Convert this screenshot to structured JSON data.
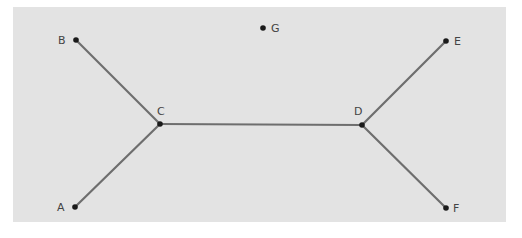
{
  "diagram": {
    "type": "graph",
    "background": "#e3e3e3",
    "edge_color": "#6e6e6e",
    "node_color": "#1a1a1a",
    "nodes": [
      {
        "id": "A",
        "label": "A",
        "x": 75,
        "y": 207,
        "label_x": 57,
        "label_y": 211
      },
      {
        "id": "B",
        "label": "B",
        "x": 76,
        "y": 40,
        "label_x": 58,
        "label_y": 44
      },
      {
        "id": "C",
        "label": "C",
        "x": 160,
        "y": 124,
        "label_x": 157,
        "label_y": 115
      },
      {
        "id": "D",
        "label": "D",
        "x": 362,
        "y": 125,
        "label_x": 354,
        "label_y": 115
      },
      {
        "id": "E",
        "label": "E",
        "x": 446,
        "y": 41,
        "label_x": 454,
        "label_y": 45
      },
      {
        "id": "F",
        "label": "F",
        "x": 446,
        "y": 208,
        "label_x": 453,
        "label_y": 212
      },
      {
        "id": "G",
        "label": "G",
        "x": 263,
        "y": 28,
        "label_x": 271,
        "label_y": 32
      }
    ],
    "edges": [
      {
        "from": "B",
        "to": "C"
      },
      {
        "from": "A",
        "to": "C"
      },
      {
        "from": "C",
        "to": "D"
      },
      {
        "from": "D",
        "to": "E"
      },
      {
        "from": "D",
        "to": "F"
      }
    ]
  }
}
